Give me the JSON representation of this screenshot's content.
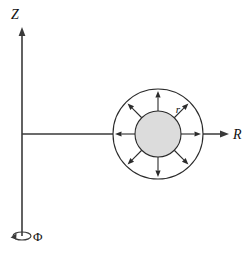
{
  "figure": {
    "background_color": "#ffffff"
  },
  "axes": {
    "vertical": {
      "label": "Z",
      "name": "z-axis",
      "direction": "up",
      "x": 22,
      "y_top": 28,
      "y_bottom": 236,
      "label_x": 15,
      "label_y": 19,
      "color": "#3a3a3a"
    },
    "horizontal": {
      "label": "R",
      "name": "r-axis",
      "direction": "right",
      "y": 134,
      "x_left": 22,
      "x_right": 228,
      "label_x": 233,
      "label_y": 139,
      "color": "#3a3a3a"
    },
    "azimuth": {
      "label": "Φ",
      "name": "phi-rotation",
      "label_x": 33,
      "label_y": 241,
      "ellipse_cx": 22,
      "ellipse_cy": 236,
      "ellipse_rx": 9,
      "ellipse_ry": 4,
      "color": "#3a3a3a"
    }
  },
  "source": {
    "center_x": 158,
    "center_y": 134,
    "outer_circle": {
      "radius": 45,
      "fill": "#ffffff",
      "stroke": "#2b2b2b"
    },
    "inner_circle": {
      "radius": 23,
      "fill": "#dcdcdc",
      "stroke": "#2b2b2b"
    },
    "radius_label": {
      "text": "r",
      "x": 178,
      "y": 113
    },
    "flux_arrows": {
      "count": 8,
      "angles_deg": [
        0,
        45,
        90,
        135,
        180,
        225,
        270,
        315
      ],
      "start_radius": 23,
      "end_radius": 43,
      "color": "#2b2b2b"
    }
  }
}
